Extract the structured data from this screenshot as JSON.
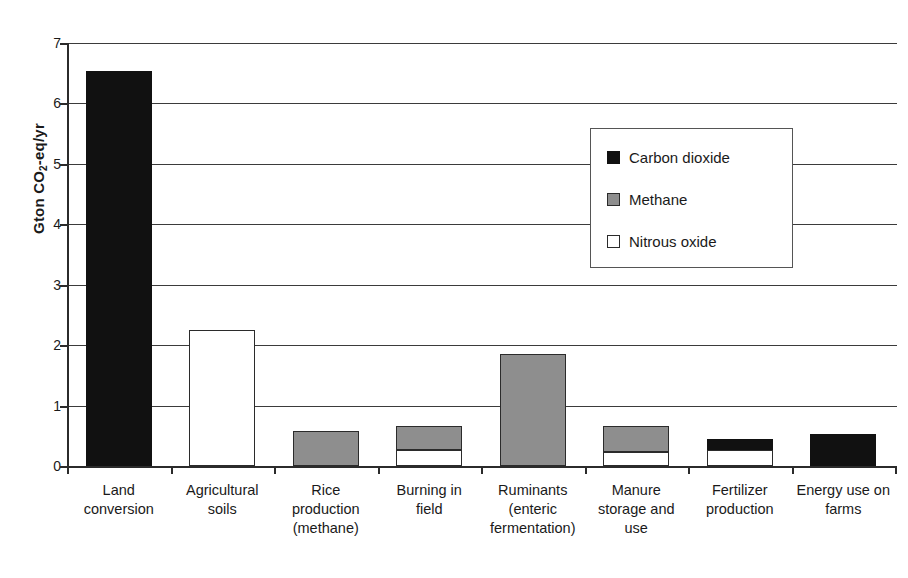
{
  "chart_data": {
    "type": "bar",
    "stacked": true,
    "title": "",
    "subtitle": "",
    "xlabel": "",
    "ylabel": "Gton CO2-eq/yr",
    "ylabel_parts": {
      "pre": "Gton CO",
      "sub": "2",
      "post": "-eq/yr"
    },
    "ylim": [
      0,
      7
    ],
    "ytick_labels": [
      "0",
      "1",
      "2",
      "3",
      "4",
      "5",
      "6",
      "7"
    ],
    "ytick_values": [
      0,
      1,
      2,
      3,
      4,
      5,
      6,
      7
    ],
    "grid": true,
    "legend_position": "inside-upper-right",
    "categories": [
      "Land conversion",
      "Agricultural soils",
      "Rice production (methane)",
      "Burning in field",
      "Ruminants (enteric fermentation)",
      "Manure storage and use",
      "Fertilizer production",
      "Energy use on farms"
    ],
    "category_label_lines": [
      [
        "Land",
        "conversion"
      ],
      [
        "Agricultural",
        "soils"
      ],
      [
        "Rice",
        "production",
        "(methane)"
      ],
      [
        "Burning in",
        "field"
      ],
      [
        "Ruminants",
        "(enteric",
        "fermentation)"
      ],
      [
        "Manure",
        "storage and",
        "use"
      ],
      [
        "Fertilizer",
        "production"
      ],
      [
        "Energy use on",
        "farms"
      ]
    ],
    "series": [
      {
        "name": "Carbon dioxide",
        "key": "co2",
        "color": "#111111",
        "values": [
          6.54,
          0,
          0,
          0,
          0,
          0,
          0.17,
          0.53
        ]
      },
      {
        "name": "Methane",
        "key": "ch4",
        "color": "#8e8e8e",
        "values": [
          0,
          0,
          0.58,
          0.4,
          1.85,
          0.43,
          0,
          0
        ]
      },
      {
        "name": "Nitrous oxide",
        "key": "n2o",
        "color": "#ffffff",
        "values": [
          0,
          2.25,
          0,
          0.26,
          0,
          0.23,
          0.27,
          0
        ]
      }
    ],
    "totals": [
      6.54,
      2.25,
      0.58,
      0.66,
      1.85,
      0.66,
      0.44,
      0.53
    ]
  },
  "legend": {
    "items": [
      {
        "label": "Carbon dioxide",
        "swatch": "black-square-icon"
      },
      {
        "label": "Methane",
        "swatch": "gray-square-icon"
      },
      {
        "label": "Nitrous oxide",
        "swatch": "white-square-icon"
      }
    ]
  },
  "colors": {
    "carbon_dioxide": "#111111",
    "methane": "#8e8e8e",
    "nitrous_oxide": "#ffffff",
    "axis": "#2b2b2b",
    "gridline": "#3b3b3b",
    "background": "#ffffff"
  }
}
